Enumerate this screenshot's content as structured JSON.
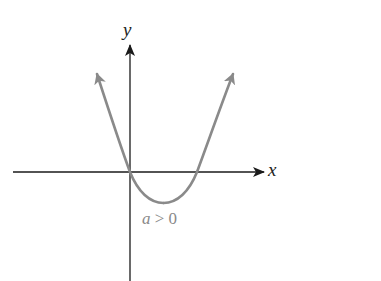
{
  "diagram": {
    "title": "",
    "axes": {
      "x_label": "x",
      "y_label": "y",
      "axis_color": "#1a1a1a"
    },
    "curve": {
      "type": "parabola (opens upward)",
      "color": "#8a8a8a",
      "roots": [
        "origin",
        "positive x"
      ],
      "condition_label_var": "a",
      "condition_label_rest": " > 0",
      "condition_label": "a > 0"
    }
  }
}
